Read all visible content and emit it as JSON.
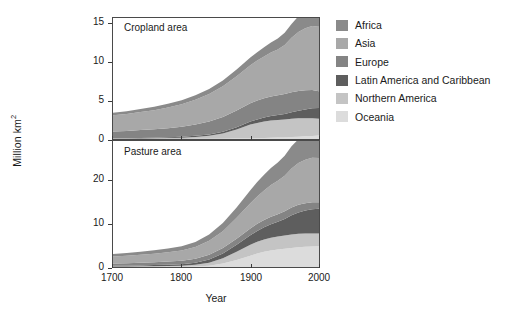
{
  "figure": {
    "ylabel": "Million km",
    "ylabel_sup": "2",
    "xlabel": "Year"
  },
  "legend": {
    "items": [
      {
        "label": "Africa",
        "color": "#8a8a8a"
      },
      {
        "label": "Asia",
        "color": "#a8a8a8"
      },
      {
        "label": "Europe",
        "color": "#848484"
      },
      {
        "label": "Latin America and Caribbean",
        "color": "#5e5e5e"
      },
      {
        "label": "Northern America",
        "color": "#c4c4c4"
      },
      {
        "label": "Oceania",
        "color": "#dcdcdc"
      }
    ]
  },
  "panels": {
    "top": {
      "title": "Cropland area",
      "yticks": [
        0,
        5,
        10,
        15
      ],
      "ylim": [
        0,
        15.8
      ],
      "xticks": [
        1700,
        1800,
        1900,
        2000
      ],
      "xlim": [
        1700,
        2000
      ]
    },
    "bottom": {
      "title": "Pasture area",
      "yticks": [
        0,
        10,
        20
      ],
      "ylim": [
        0,
        29
      ],
      "xticks": [
        1700,
        1800,
        1900,
        2000
      ],
      "xlim": [
        1700,
        2000
      ]
    }
  },
  "chart_data": [
    {
      "type": "area",
      "title": "Cropland area",
      "xlabel": "Year",
      "ylabel": "Million km2",
      "stacked": true,
      "xlim": [
        1700,
        2000
      ],
      "ylim": [
        0,
        15.8
      ],
      "yticks": [
        0,
        5,
        10,
        15
      ],
      "xticks": [
        1700,
        1800,
        1900,
        2000
      ],
      "grid": false,
      "legend_position": "right",
      "x": [
        1700,
        1720,
        1740,
        1760,
        1780,
        1800,
        1820,
        1840,
        1860,
        1880,
        1900,
        1910,
        1920,
        1930,
        1940,
        1950,
        1960,
        1970,
        1980,
        1990,
        2000
      ],
      "series": [
        {
          "name": "Oceania",
          "values": [
            0.01,
            0.01,
            0.01,
            0.01,
            0.01,
            0.01,
            0.02,
            0.02,
            0.03,
            0.05,
            0.08,
            0.1,
            0.13,
            0.16,
            0.18,
            0.21,
            0.25,
            0.3,
            0.35,
            0.4,
            0.45
          ]
        },
        {
          "name": "Northern America",
          "values": [
            0.04,
            0.05,
            0.07,
            0.09,
            0.12,
            0.16,
            0.25,
            0.4,
            0.7,
            1.2,
            1.8,
            2.0,
            2.15,
            2.25,
            2.3,
            2.35,
            2.4,
            2.4,
            2.35,
            2.3,
            2.2
          ]
        },
        {
          "name": "Latin America and Caribbean",
          "values": [
            0.04,
            0.05,
            0.06,
            0.07,
            0.09,
            0.11,
            0.14,
            0.18,
            0.23,
            0.3,
            0.4,
            0.46,
            0.52,
            0.58,
            0.64,
            0.72,
            0.85,
            1.0,
            1.15,
            1.3,
            1.4
          ]
        },
        {
          "name": "Europe",
          "values": [
            0.9,
            0.95,
            1.02,
            1.1,
            1.2,
            1.32,
            1.48,
            1.68,
            1.92,
            2.18,
            2.4,
            2.48,
            2.52,
            2.56,
            2.58,
            2.6,
            2.62,
            2.58,
            2.5,
            2.4,
            2.2
          ]
        },
        {
          "name": "Asia",
          "values": [
            2.1,
            2.2,
            2.35,
            2.5,
            2.7,
            2.95,
            3.25,
            3.6,
            4.0,
            4.45,
            4.95,
            5.2,
            5.45,
            5.75,
            6.0,
            6.4,
            7.1,
            7.7,
            8.1,
            8.35,
            8.4
          ]
        },
        {
          "name": "Africa",
          "values": [
            0.35,
            0.37,
            0.4,
            0.43,
            0.47,
            0.52,
            0.58,
            0.66,
            0.76,
            0.88,
            1.02,
            1.1,
            1.2,
            1.3,
            1.42,
            1.58,
            1.8,
            2.05,
            2.3,
            2.5,
            2.6
          ]
        }
      ]
    },
    {
      "type": "area",
      "title": "Pasture area",
      "xlabel": "Year",
      "ylabel": "Million km2",
      "stacked": true,
      "xlim": [
        1700,
        2000
      ],
      "ylim": [
        0,
        29
      ],
      "yticks": [
        0,
        10,
        20
      ],
      "xticks": [
        1700,
        1800,
        1900,
        2000
      ],
      "grid": false,
      "legend_position": "right",
      "x": [
        1700,
        1720,
        1740,
        1760,
        1780,
        1800,
        1820,
        1840,
        1860,
        1880,
        1900,
        1910,
        1920,
        1930,
        1940,
        1950,
        1960,
        1970,
        1980,
        1990,
        2000
      ],
      "series": [
        {
          "name": "Oceania",
          "values": [
            0.02,
            0.02,
            0.02,
            0.03,
            0.03,
            0.04,
            0.1,
            0.3,
            0.8,
            1.6,
            2.6,
            3.1,
            3.5,
            3.8,
            4.0,
            4.2,
            4.4,
            4.55,
            4.65,
            4.7,
            4.75
          ]
        },
        {
          "name": "Northern America",
          "values": [
            0.1,
            0.12,
            0.14,
            0.17,
            0.21,
            0.26,
            0.4,
            0.7,
            1.2,
            1.9,
            2.5,
            2.7,
            2.85,
            2.95,
            3.0,
            3.05,
            3.1,
            3.1,
            3.05,
            3.0,
            2.95
          ]
        },
        {
          "name": "Latin America and Caribbean",
          "values": [
            0.15,
            0.17,
            0.2,
            0.24,
            0.29,
            0.36,
            0.5,
            0.75,
            1.1,
            1.6,
            2.2,
            2.5,
            2.8,
            3.1,
            3.4,
            3.8,
            4.4,
            4.9,
            5.3,
            5.6,
            5.7
          ]
        },
        {
          "name": "Europe",
          "values": [
            0.55,
            0.58,
            0.62,
            0.67,
            0.73,
            0.8,
            0.92,
            1.08,
            1.25,
            1.42,
            1.58,
            1.64,
            1.68,
            1.72,
            1.74,
            1.76,
            1.78,
            1.76,
            1.7,
            1.62,
            1.5
          ]
        },
        {
          "name": "Asia",
          "values": [
            1.6,
            1.7,
            1.82,
            1.95,
            2.12,
            2.32,
            2.7,
            3.2,
            3.9,
            4.8,
            5.8,
            6.3,
            6.8,
            7.3,
            7.7,
            8.2,
            9.0,
            9.6,
            10.0,
            10.2,
            10.2
          ]
        },
        {
          "name": "Africa",
          "values": [
            0.6,
            0.64,
            0.7,
            0.77,
            0.86,
            0.97,
            1.15,
            1.45,
            1.85,
            2.4,
            3.0,
            3.3,
            3.6,
            3.9,
            4.2,
            4.6,
            5.1,
            5.5,
            5.8,
            5.95,
            6.0
          ]
        }
      ]
    }
  ]
}
